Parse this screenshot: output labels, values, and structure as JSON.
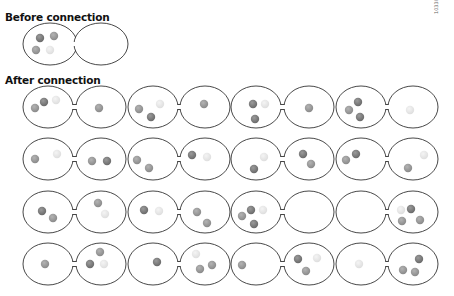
{
  "headings": {
    "before": "Before connection",
    "after": "After connection"
  },
  "figure_code": "10330",
  "colors": {
    "outline": "#333333",
    "dark": "#7a7a7a",
    "mid": "#969696",
    "light": "#e4e4e4"
  },
  "before": {
    "pair": {
      "lx": 50,
      "rx": 101,
      "cy": 44,
      "erx": 27,
      "ery": 21
    },
    "balls": [
      {
        "x": 40,
        "y": 38,
        "shade": "dark"
      },
      {
        "x": 54,
        "y": 36,
        "shade": "mid"
      },
      {
        "x": 36,
        "y": 50,
        "shade": "mid"
      },
      {
        "x": 50,
        "y": 50,
        "shade": "light"
      }
    ]
  },
  "after": {
    "pairs": [
      {
        "lx": 48,
        "rx": 101,
        "cy": 107,
        "balls": [
          {
            "x": 35,
            "y": 108,
            "shade": "mid"
          },
          {
            "x": 44,
            "y": 102,
            "shade": "dark"
          },
          {
            "x": 56,
            "y": 100,
            "shade": "light"
          },
          {
            "x": 99,
            "y": 108,
            "shade": "mid"
          }
        ]
      },
      {
        "lx": 153,
        "rx": 205,
        "cy": 107,
        "balls": [
          {
            "x": 139,
            "y": 109,
            "shade": "mid"
          },
          {
            "x": 151,
            "y": 117,
            "shade": "dark"
          },
          {
            "x": 160,
            "y": 104,
            "shade": "light"
          },
          {
            "x": 204,
            "y": 104,
            "shade": "mid"
          }
        ]
      },
      {
        "lx": 256,
        "rx": 309,
        "cy": 107,
        "balls": [
          {
            "x": 253,
            "y": 104,
            "shade": "dark"
          },
          {
            "x": 265,
            "y": 104,
            "shade": "light"
          },
          {
            "x": 255,
            "y": 119,
            "shade": "dark"
          },
          {
            "x": 309,
            "y": 108,
            "shade": "mid"
          }
        ]
      },
      {
        "lx": 361,
        "rx": 413,
        "cy": 107,
        "balls": [
          {
            "x": 349,
            "y": 110,
            "shade": "mid"
          },
          {
            "x": 358,
            "y": 102,
            "shade": "dark"
          },
          {
            "x": 360,
            "y": 117,
            "shade": "dark"
          },
          {
            "x": 410,
            "y": 110,
            "shade": "light"
          }
        ]
      },
      {
        "lx": 48,
        "rx": 101,
        "cy": 159,
        "balls": [
          {
            "x": 35,
            "y": 159,
            "shade": "mid"
          },
          {
            "x": 57,
            "y": 154,
            "shade": "light"
          },
          {
            "x": 92,
            "y": 161,
            "shade": "mid"
          },
          {
            "x": 107,
            "y": 161,
            "shade": "dark"
          }
        ]
      },
      {
        "lx": 153,
        "rx": 205,
        "cy": 159,
        "balls": [
          {
            "x": 137,
            "y": 160,
            "shade": "mid"
          },
          {
            "x": 149,
            "y": 168,
            "shade": "mid"
          },
          {
            "x": 192,
            "y": 155,
            "shade": "dark"
          },
          {
            "x": 207,
            "y": 157,
            "shade": "light"
          }
        ]
      },
      {
        "lx": 256,
        "rx": 309,
        "cy": 159,
        "balls": [
          {
            "x": 254,
            "y": 169,
            "shade": "dark"
          },
          {
            "x": 264,
            "y": 157,
            "shade": "light"
          },
          {
            "x": 303,
            "y": 154,
            "shade": "dark"
          },
          {
            "x": 311,
            "y": 164,
            "shade": "mid"
          }
        ]
      },
      {
        "lx": 361,
        "rx": 413,
        "cy": 159,
        "balls": [
          {
            "x": 346,
            "y": 160,
            "shade": "mid"
          },
          {
            "x": 356,
            "y": 154,
            "shade": "dark"
          },
          {
            "x": 424,
            "y": 155,
            "shade": "light"
          },
          {
            "x": 408,
            "y": 168,
            "shade": "mid"
          }
        ]
      },
      {
        "lx": 48,
        "rx": 101,
        "cy": 212,
        "balls": [
          {
            "x": 42,
            "y": 211,
            "shade": "dark"
          },
          {
            "x": 53,
            "y": 218,
            "shade": "mid"
          },
          {
            "x": 98,
            "y": 203,
            "shade": "mid"
          },
          {
            "x": 105,
            "y": 214,
            "shade": "light"
          }
        ]
      },
      {
        "lx": 153,
        "rx": 205,
        "cy": 212,
        "balls": [
          {
            "x": 144,
            "y": 210,
            "shade": "dark"
          },
          {
            "x": 159,
            "y": 211,
            "shade": "light"
          },
          {
            "x": 197,
            "y": 212,
            "shade": "mid"
          },
          {
            "x": 207,
            "y": 223,
            "shade": "mid"
          }
        ]
      },
      {
        "lx": 256,
        "rx": 309,
        "cy": 212,
        "balls": [
          {
            "x": 242,
            "y": 216,
            "shade": "mid"
          },
          {
            "x": 251,
            "y": 210,
            "shade": "dark"
          },
          {
            "x": 254,
            "y": 224,
            "shade": "dark"
          },
          {
            "x": 263,
            "y": 210,
            "shade": "light"
          }
        ]
      },
      {
        "lx": 361,
        "rx": 413,
        "cy": 212,
        "balls": [
          {
            "x": 401,
            "y": 210,
            "shade": "light"
          },
          {
            "x": 411,
            "y": 209,
            "shade": "dark"
          },
          {
            "x": 402,
            "y": 221,
            "shade": "mid"
          },
          {
            "x": 420,
            "y": 220,
            "shade": "mid"
          }
        ]
      },
      {
        "lx": 48,
        "rx": 101,
        "cy": 264,
        "balls": [
          {
            "x": 45,
            "y": 264,
            "shade": "mid"
          },
          {
            "x": 100,
            "y": 252,
            "shade": "mid"
          },
          {
            "x": 90,
            "y": 264,
            "shade": "dark"
          },
          {
            "x": 104,
            "y": 264,
            "shade": "light"
          }
        ]
      },
      {
        "lx": 153,
        "rx": 205,
        "cy": 264,
        "balls": [
          {
            "x": 157,
            "y": 262,
            "shade": "dark"
          },
          {
            "x": 196,
            "y": 254,
            "shade": "light"
          },
          {
            "x": 200,
            "y": 269,
            "shade": "mid"
          },
          {
            "x": 212,
            "y": 265,
            "shade": "mid"
          }
        ]
      },
      {
        "lx": 256,
        "rx": 309,
        "cy": 264,
        "balls": [
          {
            "x": 242,
            "y": 265,
            "shade": "mid"
          },
          {
            "x": 298,
            "y": 259,
            "shade": "dark"
          },
          {
            "x": 306,
            "y": 271,
            "shade": "mid"
          },
          {
            "x": 317,
            "y": 258,
            "shade": "light"
          }
        ]
      },
      {
        "lx": 361,
        "rx": 413,
        "cy": 264,
        "balls": [
          {
            "x": 359,
            "y": 264,
            "shade": "light"
          },
          {
            "x": 403,
            "y": 270,
            "shade": "mid"
          },
          {
            "x": 415,
            "y": 272,
            "shade": "mid"
          },
          {
            "x": 419,
            "y": 259,
            "shade": "dark"
          }
        ]
      }
    ]
  }
}
